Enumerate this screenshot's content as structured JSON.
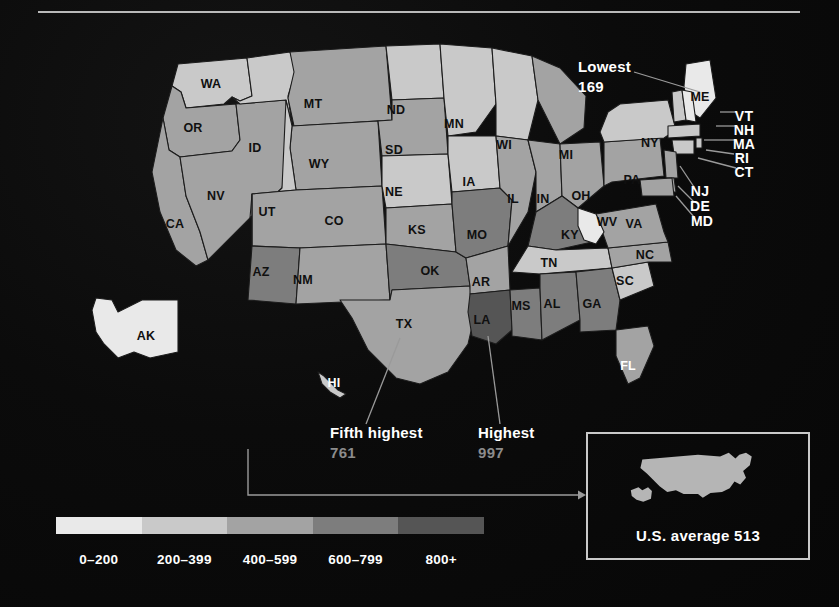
{
  "chart_data": {
    "type": "map",
    "title": "",
    "unit": "rate per 100,000",
    "national_average": 513,
    "legend": {
      "bins": [
        "0–200",
        "200–399",
        "400–599",
        "600–799",
        "800+"
      ],
      "colors": [
        "#e9e9e9",
        "#c9c9c9",
        "#a3a3a3",
        "#7d7d7d",
        "#555555"
      ]
    },
    "annotations": [
      {
        "label": "Lowest",
        "value": "169",
        "state": "ME"
      },
      {
        "label": "Fifth highest",
        "value": "761",
        "state": "TX"
      },
      {
        "label": "Highest",
        "value": "997",
        "state": "LA"
      }
    ],
    "states": [
      {
        "code": "AL",
        "bin": 3
      },
      {
        "code": "AK",
        "bin": 0
      },
      {
        "code": "AZ",
        "bin": 3
      },
      {
        "code": "AR",
        "bin": 2
      },
      {
        "code": "CA",
        "bin": 2
      },
      {
        "code": "CO",
        "bin": 2
      },
      {
        "code": "CT",
        "bin": 1
      },
      {
        "code": "DE",
        "bin": 2
      },
      {
        "code": "FL",
        "bin": 2
      },
      {
        "code": "GA",
        "bin": 3
      },
      {
        "code": "HI",
        "bin": 1
      },
      {
        "code": "ID",
        "bin": 1
      },
      {
        "code": "IL",
        "bin": 2
      },
      {
        "code": "IN",
        "bin": 2
      },
      {
        "code": "IA",
        "bin": 1
      },
      {
        "code": "KS",
        "bin": 2
      },
      {
        "code": "KY",
        "bin": 3
      },
      {
        "code": "LA",
        "bin": 4
      },
      {
        "code": "ME",
        "bin": 0
      },
      {
        "code": "MD",
        "bin": 2
      },
      {
        "code": "MA",
        "bin": 1
      },
      {
        "code": "MI",
        "bin": 2
      },
      {
        "code": "MN",
        "bin": 1
      },
      {
        "code": "MS",
        "bin": 3
      },
      {
        "code": "MO",
        "bin": 3
      },
      {
        "code": "MT",
        "bin": 2
      },
      {
        "code": "NE",
        "bin": 1
      },
      {
        "code": "NV",
        "bin": 2
      },
      {
        "code": "NH",
        "bin": 0
      },
      {
        "code": "NJ",
        "bin": 2
      },
      {
        "code": "NM",
        "bin": 2
      },
      {
        "code": "NY",
        "bin": 1
      },
      {
        "code": "NC",
        "bin": 2
      },
      {
        "code": "ND",
        "bin": 1
      },
      {
        "code": "OH",
        "bin": 2
      },
      {
        "code": "OK",
        "bin": 3
      },
      {
        "code": "OR",
        "bin": 2
      },
      {
        "code": "PA",
        "bin": 2
      },
      {
        "code": "RI",
        "bin": 1
      },
      {
        "code": "SC",
        "bin": 1
      },
      {
        "code": "SD",
        "bin": 2
      },
      {
        "code": "TN",
        "bin": 1
      },
      {
        "code": "TX",
        "bin": 2
      },
      {
        "code": "UT",
        "bin": 1
      },
      {
        "code": "VT",
        "bin": 1
      },
      {
        "code": "VA",
        "bin": 2
      },
      {
        "code": "WA",
        "bin": 1
      },
      {
        "code": "WV",
        "bin": 0
      },
      {
        "code": "WI",
        "bin": 1
      },
      {
        "code": "WY",
        "bin": 2
      }
    ]
  },
  "state_labels": [
    {
      "code": "WA",
      "x": 211,
      "y": 84,
      "tone": "dark"
    },
    {
      "code": "OR",
      "x": 193,
      "y": 128,
      "tone": "dark"
    },
    {
      "code": "CA",
      "x": 175,
      "y": 224,
      "tone": "dark"
    },
    {
      "code": "NV",
      "x": 216,
      "y": 196,
      "tone": "dark"
    },
    {
      "code": "ID",
      "x": 255,
      "y": 148,
      "tone": "dark"
    },
    {
      "code": "UT",
      "x": 267,
      "y": 212,
      "tone": "dark"
    },
    {
      "code": "AZ",
      "x": 261,
      "y": 272,
      "tone": "dark"
    },
    {
      "code": "MT",
      "x": 313,
      "y": 104,
      "tone": "dark"
    },
    {
      "code": "WY",
      "x": 319,
      "y": 164,
      "tone": "dark"
    },
    {
      "code": "CO",
      "x": 334,
      "y": 221,
      "tone": "dark"
    },
    {
      "code": "NM",
      "x": 303,
      "y": 280,
      "tone": "dark"
    },
    {
      "code": "ND",
      "x": 396,
      "y": 110,
      "tone": "dark"
    },
    {
      "code": "SD",
      "x": 394,
      "y": 150,
      "tone": "dark"
    },
    {
      "code": "NE",
      "x": 394,
      "y": 192,
      "tone": "dark"
    },
    {
      "code": "KS",
      "x": 417,
      "y": 230,
      "tone": "dark"
    },
    {
      "code": "OK",
      "x": 430,
      "y": 271,
      "tone": "dark"
    },
    {
      "code": "TX",
      "x": 404,
      "y": 324,
      "tone": "dark"
    },
    {
      "code": "MN",
      "x": 454,
      "y": 124,
      "tone": "dark"
    },
    {
      "code": "IA",
      "x": 469,
      "y": 182,
      "tone": "dark"
    },
    {
      "code": "MO",
      "x": 477,
      "y": 235,
      "tone": "dark"
    },
    {
      "code": "AR",
      "x": 481,
      "y": 282,
      "tone": "dark"
    },
    {
      "code": "LA",
      "x": 482,
      "y": 320,
      "tone": "dark"
    },
    {
      "code": "WI",
      "x": 504,
      "y": 145,
      "tone": "dark"
    },
    {
      "code": "IL",
      "x": 513,
      "y": 199,
      "tone": "dark"
    },
    {
      "code": "MS",
      "x": 521,
      "y": 306,
      "tone": "dark"
    },
    {
      "code": "IN",
      "x": 543,
      "y": 199,
      "tone": "dark"
    },
    {
      "code": "MI",
      "x": 566,
      "y": 155,
      "tone": "dark"
    },
    {
      "code": "KY",
      "x": 570,
      "y": 235,
      "tone": "dark"
    },
    {
      "code": "TN",
      "x": 549,
      "y": 263,
      "tone": "dark"
    },
    {
      "code": "AL",
      "x": 552,
      "y": 304,
      "tone": "dark"
    },
    {
      "code": "OH",
      "x": 581,
      "y": 196,
      "tone": "dark"
    },
    {
      "code": "GA",
      "x": 592,
      "y": 304,
      "tone": "dark"
    },
    {
      "code": "WV",
      "x": 607,
      "y": 222,
      "tone": "dark"
    },
    {
      "code": "VA",
      "x": 634,
      "y": 224,
      "tone": "dark"
    },
    {
      "code": "NC",
      "x": 645,
      "y": 255,
      "tone": "dark"
    },
    {
      "code": "SC",
      "x": 625,
      "y": 281,
      "tone": "dark"
    },
    {
      "code": "FL",
      "x": 628,
      "y": 366,
      "tone": "light"
    },
    {
      "code": "PA",
      "x": 632,
      "y": 180,
      "tone": "dark"
    },
    {
      "code": "NY",
      "x": 650,
      "y": 143,
      "tone": "dark"
    },
    {
      "code": "ME",
      "x": 700,
      "y": 97,
      "tone": "dark"
    },
    {
      "code": "AK",
      "x": 146,
      "y": 336,
      "tone": "dark"
    },
    {
      "code": "HI",
      "x": 334,
      "y": 383,
      "tone": "light"
    }
  ],
  "callout_labels": [
    {
      "code": "VT",
      "x": 744,
      "y": 116
    },
    {
      "code": "NH",
      "x": 744,
      "y": 130
    },
    {
      "code": "MA",
      "x": 744,
      "y": 144
    },
    {
      "code": "RI",
      "x": 742,
      "y": 158
    },
    {
      "code": "CT",
      "x": 744,
      "y": 172
    },
    {
      "code": "NJ",
      "x": 700,
      "y": 191
    },
    {
      "code": "DE",
      "x": 700,
      "y": 206
    },
    {
      "code": "MD",
      "x": 702,
      "y": 221
    }
  ],
  "inset": {
    "caption": "U.S. average 513"
  },
  "colors": {
    "background": "#0a0a0a",
    "rule": "#b9b9b9",
    "leader": "#9a9a9a",
    "inset_border": "#c9c9c9",
    "inset_fill": "#b5b5b5"
  }
}
